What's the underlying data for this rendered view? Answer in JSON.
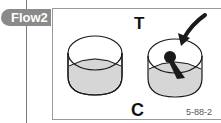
{
  "tab": {
    "label": "Flow2"
  },
  "figure": {
    "top_label": "T",
    "bottom_label": "C",
    "code": "5-88-2",
    "colors": {
      "tab_bg": "#8a8a8a",
      "cup_fill": "#d6d6d6",
      "ink": "#1a1a1a",
      "frame": "#9a9a9a"
    }
  }
}
